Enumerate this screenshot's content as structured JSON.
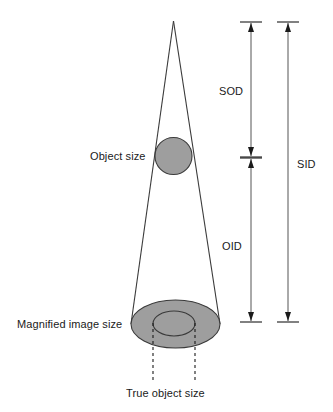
{
  "diagram": {
    "type": "radiographic-magnification-schematic",
    "colors": {
      "shape_fill": "#9e9e9e",
      "stroke": "#3a3a3a",
      "text": "#1a1a1a",
      "background": "#ffffff"
    },
    "labels": {
      "object_size": "Object size",
      "magnified_image_size": "Magnified image size",
      "true_object_size": "True object size",
      "sod": "SOD",
      "oid": "OID",
      "sid": "SID"
    },
    "geometry": {
      "apex": {
        "x": 173.5,
        "y": 21
      },
      "beam_left_bottom": {
        "x": 131,
        "y": 324
      },
      "beam_right_bottom": {
        "x": 220,
        "y": 324
      },
      "object_circle": {
        "cx": 173.5,
        "cy": 156,
        "r": 18.5
      },
      "magnified_ellipse": {
        "cx": 175.5,
        "cy": 324,
        "rx": 44.5,
        "ry": 24
      },
      "true_object_ellipse": {
        "cx": 174,
        "cy": 323.5,
        "rx": 21,
        "ry": 12.5
      },
      "dashed_left": {
        "x": 153,
        "y1": 323,
        "y2": 381
      },
      "dashed_right": {
        "x": 195,
        "y1": 323,
        "y2": 381
      }
    },
    "measures": [
      {
        "name": "SOD",
        "axis_x": 251,
        "top_y": 22,
        "bottom_y": 157,
        "tick_half_width": 11
      },
      {
        "name": "OID",
        "axis_x": 251,
        "top_y": 157,
        "bottom_y": 322,
        "tick_half_width": 11
      },
      {
        "name": "SID",
        "axis_x": 288,
        "top_y": 22,
        "bottom_y": 322,
        "tick_half_width": 11
      }
    ]
  }
}
